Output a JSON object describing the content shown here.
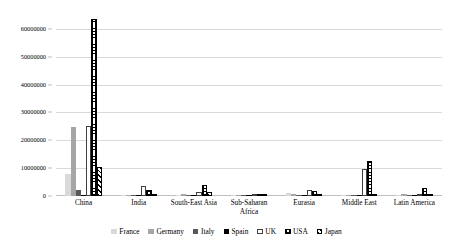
{
  "chart_data": {
    "type": "bar",
    "title": "",
    "subtitle": "",
    "xlabel": "",
    "ylabel": "",
    "ylim": [
      0,
      65000000
    ],
    "grid": true,
    "legend_position": "bottom",
    "categories": [
      "China",
      "India",
      "South-East Asia",
      "Sub-Saharan\nAfrica",
      "Eurasia",
      "Middle East",
      "Latin America"
    ],
    "y_ticks": [
      0,
      10000000,
      20000000,
      30000000,
      40000000,
      50000000,
      60000000
    ],
    "y_tick_labels": [
      "0",
      "10000000",
      "20000000",
      "30000000",
      "40000000",
      "50000000",
      "60000000"
    ],
    "series": [
      {
        "name": "France",
        "color": "#d9d9d9",
        "pattern": "solid-light-gray",
        "values": [
          8000000,
          200000,
          250000,
          120000,
          1100000,
          200000,
          250000
        ]
      },
      {
        "name": "Germany",
        "color": "#a6a6a6",
        "pattern": "solid-medium-gray",
        "values": [
          24700000,
          300000,
          900000,
          150000,
          750000,
          350000,
          800000
        ]
      },
      {
        "name": "Italy",
        "color": "#595959",
        "pattern": "solid-dark-gray",
        "values": [
          2300000,
          150000,
          200000,
          100000,
          400000,
          200000,
          300000
        ]
      },
      {
        "name": "Spain",
        "color": "#000000",
        "pattern": "solid-black",
        "values": [
          500000,
          120000,
          150000,
          120000,
          250000,
          300000,
          200000
        ]
      },
      {
        "name": "UK",
        "color": "#ffffff",
        "pattern": "outline-white",
        "values": [
          25100000,
          3500000,
          1300000,
          200000,
          2200000,
          9700000,
          500000
        ]
      },
      {
        "name": "USA",
        "color": "#ffffff",
        "pattern": "crosshatch-grid",
        "values": [
          63700000,
          2000000,
          3800000,
          300000,
          1800000,
          12700000,
          2700000
        ]
      },
      {
        "name": "Japan",
        "color": "#ffffff",
        "pattern": "diagonal-stripe",
        "values": [
          10400000,
          250000,
          1500000,
          400000,
          700000,
          250000,
          300000
        ]
      }
    ]
  }
}
